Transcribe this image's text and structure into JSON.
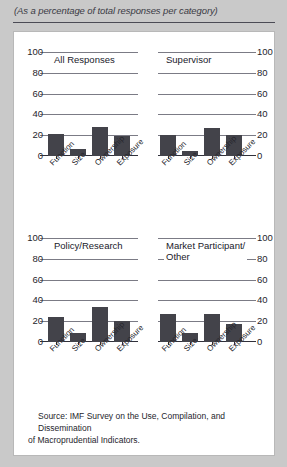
{
  "header": {
    "subtitle": "(As a percentage of total responses per category)"
  },
  "source": {
    "line1": "Source: IMF Survey on the Use, Compilation, and Dissemination",
    "line2": "of Macroprudential Indicators."
  },
  "chart_data": [
    {
      "type": "bar",
      "title": "All Responses",
      "categories": [
        "Function",
        "Size",
        "Ownership",
        "Exposure"
      ],
      "values": [
        21,
        7,
        28,
        19
      ],
      "xlabel": "",
      "ylabel": "",
      "ylim": [
        0,
        100
      ],
      "yticks": [
        100,
        80,
        60,
        40,
        20,
        0
      ],
      "grid": true,
      "axis_side": "left",
      "legend": "none"
    },
    {
      "type": "bar",
      "title": "Supervisor",
      "categories": [
        "Function",
        "Size",
        "Ownership",
        "Exposure"
      ],
      "values": [
        20,
        5,
        27,
        20
      ],
      "xlabel": "",
      "ylabel": "",
      "ylim": [
        0,
        100
      ],
      "yticks": [
        100,
        80,
        60,
        40,
        20,
        0
      ],
      "grid": true,
      "axis_side": "right",
      "legend": "none"
    },
    {
      "type": "bar",
      "title": "Policy/Research",
      "categories": [
        "Function",
        "Size",
        "Ownership",
        "Exposure"
      ],
      "values": [
        24,
        9,
        34,
        20
      ],
      "xlabel": "",
      "ylabel": "",
      "ylim": [
        0,
        100
      ],
      "yticks": [
        100,
        80,
        60,
        40,
        20,
        0
      ],
      "grid": true,
      "axis_side": "left",
      "legend": "none"
    },
    {
      "type": "bar",
      "title": "Market Participant/\nOther",
      "categories": [
        "Function",
        "Size",
        "Ownership",
        "Exposure"
      ],
      "values": [
        27,
        9,
        27,
        17
      ],
      "xlabel": "",
      "ylabel": "",
      "ylim": [
        0,
        100
      ],
      "yticks": [
        100,
        80,
        60,
        40,
        20,
        0
      ],
      "grid": true,
      "axis_side": "right",
      "legend": "none"
    }
  ],
  "style": {
    "bar_color": "#43434a",
    "grid_color": "#7b7b85",
    "axis_color": "#30303a",
    "card_background": "#ffffff",
    "page_background": "#c9c9c9"
  }
}
